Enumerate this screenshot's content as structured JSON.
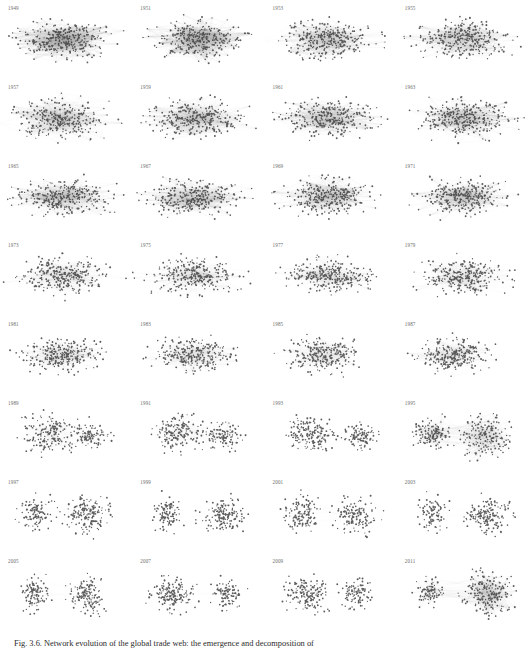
{
  "figure": {
    "caption_label": "Fig. 3.6.",
    "caption_text": "Fig. 3.6. Network evolution of the global trade web: the emergence and decomposition of",
    "background_color": "#ffffff",
    "node_color": "#3a3a3a",
    "edge_color": "#9a9a9a",
    "label_color": "#6d6d6d",
    "grid": {
      "columns": 4,
      "rows": 8,
      "panel_count": 32
    }
  },
  "panels": [
    {
      "label": "1949",
      "clusters": 1,
      "shape": "elongated",
      "density": "high",
      "edge_density": "very-high",
      "seed": 11,
      "nodes": 300,
      "cx": [
        0.47
      ],
      "cy": [
        0.5
      ],
      "rx": [
        0.4
      ],
      "ry": [
        0.27
      ],
      "weight": [
        1.0
      ]
    },
    {
      "label": "1951",
      "clusters": 1,
      "shape": "elongated",
      "density": "high",
      "edge_density": "very-high",
      "seed": 23,
      "nodes": 300,
      "cx": [
        0.5
      ],
      "cy": [
        0.48
      ],
      "rx": [
        0.37
      ],
      "ry": [
        0.28
      ],
      "weight": [
        1.0
      ]
    },
    {
      "label": "1953",
      "clusters": 1,
      "shape": "elongated",
      "density": "high",
      "edge_density": "high",
      "seed": 37,
      "nodes": 300,
      "cx": [
        0.48
      ],
      "cy": [
        0.5
      ],
      "rx": [
        0.4
      ],
      "ry": [
        0.26
      ],
      "weight": [
        1.0
      ]
    },
    {
      "label": "1955",
      "clusters": 1,
      "shape": "elongated",
      "density": "high",
      "edge_density": "high",
      "seed": 41,
      "nodes": 300,
      "cx": [
        0.49
      ],
      "cy": [
        0.5
      ],
      "rx": [
        0.4
      ],
      "ry": [
        0.26
      ],
      "weight": [
        1.0
      ]
    },
    {
      "label": "1957",
      "clusters": 1,
      "shape": "elongated",
      "density": "high",
      "edge_density": "high",
      "seed": 53,
      "nodes": 300,
      "cx": [
        0.47
      ],
      "cy": [
        0.51
      ],
      "rx": [
        0.4
      ],
      "ry": [
        0.27
      ],
      "weight": [
        1.0
      ]
    },
    {
      "label": "1959",
      "clusters": 1,
      "shape": "elongated",
      "density": "high",
      "edge_density": "high",
      "seed": 67,
      "nodes": 300,
      "cx": [
        0.49
      ],
      "cy": [
        0.5
      ],
      "rx": [
        0.4
      ],
      "ry": [
        0.26
      ],
      "weight": [
        1.0
      ]
    },
    {
      "label": "1961",
      "clusters": 1,
      "shape": "elongated",
      "density": "high",
      "edge_density": "high",
      "seed": 71,
      "nodes": 300,
      "cx": [
        0.48
      ],
      "cy": [
        0.5
      ],
      "rx": [
        0.4
      ],
      "ry": [
        0.26
      ],
      "weight": [
        1.0
      ]
    },
    {
      "label": "1963",
      "clusters": 1,
      "shape": "elongated",
      "density": "high",
      "edge_density": "high",
      "seed": 83,
      "nodes": 300,
      "cx": [
        0.5
      ],
      "cy": [
        0.5
      ],
      "rx": [
        0.39
      ],
      "ry": [
        0.26
      ],
      "weight": [
        1.0
      ]
    },
    {
      "label": "1965",
      "clusters": 1,
      "shape": "elongated",
      "density": "high",
      "edge_density": "high",
      "seed": 97,
      "nodes": 300,
      "cx": [
        0.48
      ],
      "cy": [
        0.5
      ],
      "rx": [
        0.4
      ],
      "ry": [
        0.25
      ],
      "weight": [
        1.0
      ]
    },
    {
      "label": "1967",
      "clusters": 1,
      "shape": "elongated",
      "density": "high",
      "edge_density": "high",
      "seed": 101,
      "nodes": 300,
      "cx": [
        0.47
      ],
      "cy": [
        0.5
      ],
      "rx": [
        0.39
      ],
      "ry": [
        0.26
      ],
      "weight": [
        1.0
      ]
    },
    {
      "label": "1969",
      "clusters": 1,
      "shape": "elongated",
      "density": "high",
      "edge_density": "high",
      "seed": 113,
      "nodes": 300,
      "cx": [
        0.48
      ],
      "cy": [
        0.5
      ],
      "rx": [
        0.38
      ],
      "ry": [
        0.25
      ],
      "weight": [
        1.0
      ]
    },
    {
      "label": "1971",
      "clusters": 1,
      "shape": "elongated",
      "density": "high",
      "edge_density": "high",
      "seed": 127,
      "nodes": 300,
      "cx": [
        0.49
      ],
      "cy": [
        0.5
      ],
      "rx": [
        0.38
      ],
      "ry": [
        0.25
      ],
      "weight": [
        1.0
      ]
    },
    {
      "label": "1973",
      "clusters": 1,
      "shape": "elongated",
      "density": "medium",
      "edge_density": "medium",
      "seed": 131,
      "nodes": 290,
      "cx": [
        0.48
      ],
      "cy": [
        0.5
      ],
      "rx": [
        0.38
      ],
      "ry": [
        0.25
      ],
      "weight": [
        1.0
      ]
    },
    {
      "label": "1975",
      "clusters": 1,
      "shape": "elongated",
      "density": "medium",
      "edge_density": "medium",
      "seed": 149,
      "nodes": 290,
      "cx": [
        0.46
      ],
      "cy": [
        0.5
      ],
      "rx": [
        0.37
      ],
      "ry": [
        0.24
      ],
      "weight": [
        1.0
      ]
    },
    {
      "label": "1977",
      "clusters": 1,
      "shape": "elongated",
      "density": "medium",
      "edge_density": "medium",
      "seed": 151,
      "nodes": 285,
      "cx": [
        0.48
      ],
      "cy": [
        0.5
      ],
      "rx": [
        0.37
      ],
      "ry": [
        0.24
      ],
      "weight": [
        1.0
      ]
    },
    {
      "label": "1979",
      "clusters": 1,
      "shape": "elongated",
      "density": "medium",
      "edge_density": "medium",
      "seed": 163,
      "nodes": 285,
      "cx": [
        0.5
      ],
      "cy": [
        0.5
      ],
      "rx": [
        0.36
      ],
      "ry": [
        0.24
      ],
      "weight": [
        1.0
      ]
    },
    {
      "label": "1981",
      "clusters": 1,
      "shape": "elongated",
      "density": "medium",
      "edge_density": "medium",
      "seed": 173,
      "nodes": 280,
      "cx": [
        0.46
      ],
      "cy": [
        0.5
      ],
      "rx": [
        0.36
      ],
      "ry": [
        0.23
      ],
      "weight": [
        1.0
      ]
    },
    {
      "label": "1983",
      "clusters": 1,
      "shape": "elongated",
      "density": "medium",
      "edge_density": "medium",
      "seed": 181,
      "nodes": 275,
      "cx": [
        0.46
      ],
      "cy": [
        0.5
      ],
      "rx": [
        0.34
      ],
      "ry": [
        0.23
      ],
      "weight": [
        1.0
      ]
    },
    {
      "label": "1985",
      "clusters": 1,
      "shape": "compact",
      "density": "medium",
      "edge_density": "medium",
      "seed": 193,
      "nodes": 270,
      "cx": [
        0.44
      ],
      "cy": [
        0.5
      ],
      "rx": [
        0.31
      ],
      "ry": [
        0.24
      ],
      "weight": [
        1.0
      ]
    },
    {
      "label": "1987",
      "clusters": 1,
      "shape": "compact",
      "density": "medium",
      "edge_density": "medium",
      "seed": 197,
      "nodes": 265,
      "cx": [
        0.44
      ],
      "cy": [
        0.5
      ],
      "rx": [
        0.3
      ],
      "ry": [
        0.24
      ],
      "weight": [
        1.0
      ]
    },
    {
      "label": "1989",
      "clusters": 2,
      "shape": "split",
      "density": "medium",
      "edge_density": "medium",
      "seed": 211,
      "nodes": 280,
      "cx": [
        0.37,
        0.68
      ],
      "cy": [
        0.5,
        0.52
      ],
      "rx": [
        0.24,
        0.16
      ],
      "ry": [
        0.26,
        0.2
      ],
      "weight": [
        0.62,
        0.38
      ]
    },
    {
      "label": "1991",
      "clusters": 2,
      "shape": "split",
      "density": "medium",
      "edge_density": "medium",
      "seed": 223,
      "nodes": 280,
      "cx": [
        0.35,
        0.7
      ],
      "cy": [
        0.5,
        0.52
      ],
      "rx": [
        0.22,
        0.15
      ],
      "ry": [
        0.26,
        0.19
      ],
      "weight": [
        0.62,
        0.38
      ]
    },
    {
      "label": "1993",
      "clusters": 2,
      "shape": "split",
      "density": "medium",
      "edge_density": "low",
      "seed": 227,
      "nodes": 280,
      "cx": [
        0.33,
        0.72
      ],
      "cy": [
        0.5,
        0.53
      ],
      "rx": [
        0.21,
        0.14
      ],
      "ry": [
        0.26,
        0.18
      ],
      "weight": [
        0.64,
        0.36
      ]
    },
    {
      "label": "1995",
      "clusters": 2,
      "shape": "split",
      "density": "high",
      "edge_density": "very-high",
      "seed": 239,
      "nodes": 300,
      "cx": [
        0.27,
        0.68
      ],
      "cy": [
        0.48,
        0.52
      ],
      "rx": [
        0.16,
        0.22
      ],
      "ry": [
        0.22,
        0.3
      ],
      "weight": [
        0.38,
        0.62
      ]
    },
    {
      "label": "1997",
      "clusters": 2,
      "shape": "split",
      "density": "medium",
      "edge_density": "low",
      "seed": 251,
      "nodes": 270,
      "cx": [
        0.27,
        0.66
      ],
      "cy": [
        0.5,
        0.52
      ],
      "rx": [
        0.14,
        0.19
      ],
      "ry": [
        0.25,
        0.26
      ],
      "weight": [
        0.42,
        0.58
      ]
    },
    {
      "label": "1999",
      "clusters": 2,
      "shape": "split",
      "density": "medium",
      "edge_density": "low",
      "seed": 257,
      "nodes": 265,
      "cx": [
        0.26,
        0.68
      ],
      "cy": [
        0.5,
        0.52
      ],
      "rx": [
        0.13,
        0.18
      ],
      "ry": [
        0.24,
        0.25
      ],
      "weight": [
        0.4,
        0.6
      ]
    },
    {
      "label": "2001",
      "clusters": 2,
      "shape": "split",
      "density": "medium",
      "edge_density": "low",
      "seed": 263,
      "nodes": 265,
      "cx": [
        0.28,
        0.68
      ],
      "cy": [
        0.5,
        0.52
      ],
      "rx": [
        0.15,
        0.18
      ],
      "ry": [
        0.26,
        0.25
      ],
      "weight": [
        0.44,
        0.56
      ]
    },
    {
      "label": "2003",
      "clusters": 2,
      "shape": "split",
      "density": "medium",
      "edge_density": "low",
      "seed": 269,
      "nodes": 265,
      "cx": [
        0.27,
        0.69
      ],
      "cy": [
        0.5,
        0.52
      ],
      "rx": [
        0.13,
        0.19
      ],
      "ry": [
        0.23,
        0.26
      ],
      "weight": [
        0.38,
        0.62
      ]
    },
    {
      "label": "2005",
      "clusters": 2,
      "shape": "split",
      "density": "medium",
      "edge_density": "low",
      "seed": 277,
      "nodes": 260,
      "cx": [
        0.26,
        0.66
      ],
      "cy": [
        0.5,
        0.52
      ],
      "rx": [
        0.13,
        0.18
      ],
      "ry": [
        0.23,
        0.25
      ],
      "weight": [
        0.38,
        0.62
      ]
    },
    {
      "label": "2007",
      "clusters": 2,
      "shape": "split",
      "density": "medium",
      "edge_density": "low",
      "seed": 281,
      "nodes": 260,
      "cx": [
        0.3,
        0.72
      ],
      "cy": [
        0.52,
        0.52
      ],
      "rx": [
        0.18,
        0.13
      ],
      "ry": [
        0.26,
        0.2
      ],
      "weight": [
        0.62,
        0.38
      ]
    },
    {
      "label": "2009",
      "clusters": 2,
      "shape": "split",
      "density": "medium",
      "edge_density": "low",
      "seed": 293,
      "nodes": 265,
      "cx": [
        0.32,
        0.7
      ],
      "cy": [
        0.52,
        0.52
      ],
      "rx": [
        0.19,
        0.14
      ],
      "ry": [
        0.26,
        0.22
      ],
      "weight": [
        0.6,
        0.4
      ]
    },
    {
      "label": "2011",
      "clusters": 2,
      "shape": "split",
      "density": "high",
      "edge_density": "very-high",
      "seed": 307,
      "nodes": 290,
      "cx": [
        0.25,
        0.68
      ],
      "cy": [
        0.5,
        0.52
      ],
      "rx": [
        0.12,
        0.22
      ],
      "ry": [
        0.2,
        0.3
      ],
      "weight": [
        0.32,
        0.68
      ]
    }
  ]
}
